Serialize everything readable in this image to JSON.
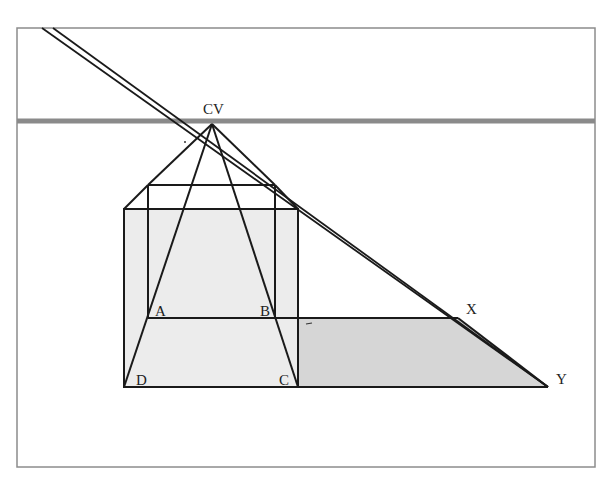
{
  "figure": {
    "type": "perspective-drawing",
    "colors": {
      "line": "#1a1a1a",
      "horizon": "#8a8a8a",
      "frame": "#8c8c8c",
      "box_fill": "#ececec",
      "floor_fill": "#d6d6d6",
      "background": "#ffffff"
    }
  },
  "labels": {
    "cv": "CV",
    "a": "A",
    "b": "B",
    "c": "C",
    "d": "D",
    "x": "X",
    "y": "Y"
  },
  "points": {
    "CV": [
      212,
      124
    ],
    "A": [
      148,
      318
    ],
    "B": [
      275,
      318
    ],
    "C": [
      298,
      387
    ],
    "D": [
      124,
      387
    ],
    "X": [
      458,
      318
    ],
    "Y": [
      548,
      387
    ]
  }
}
